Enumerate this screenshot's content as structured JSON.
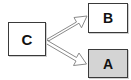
{
  "diagram": {
    "canvas": {
      "width": "131",
      "height": "80",
      "background": "#ffffff"
    },
    "nodes": [
      {
        "id": "C",
        "label": "C",
        "shape": "rectangle",
        "fill": "#ffffff",
        "border": "#3a3a3a",
        "x": 8,
        "y": 22,
        "width": 38,
        "height": 34
      },
      {
        "id": "B",
        "label": "B",
        "shape": "rectangle",
        "fill": "#ffffff",
        "border": "#3a3a3a",
        "x": 88,
        "y": 3,
        "width": 40,
        "height": 30
      },
      {
        "id": "A",
        "label": "A",
        "shape": "rectangle",
        "fill": "#d4d4d4",
        "border": "#3a3a3a",
        "x": 88,
        "y": 49,
        "width": 40,
        "height": 29
      }
    ],
    "edges": [
      {
        "id": "edge-c-to-b",
        "from": "C",
        "to": "B",
        "style": "hollow-block-arrow",
        "direction": "up-right",
        "stroke": "#8a8a8a",
        "fill": "#ffffff",
        "label": ""
      },
      {
        "id": "edge-c-to-a",
        "from": "C",
        "to": "A",
        "style": "hollow-block-arrow",
        "direction": "down-right",
        "stroke": "#8a8a8a",
        "fill": "#ffffff",
        "label": ""
      }
    ]
  }
}
